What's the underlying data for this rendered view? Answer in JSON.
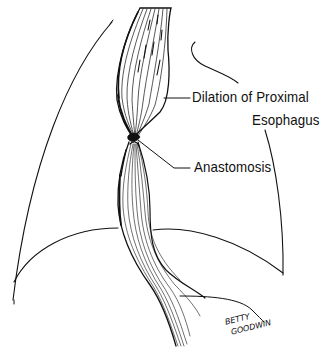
{
  "figure": {
    "type": "medical-illustration",
    "labels": [
      {
        "id": "dilation",
        "line1": "Dilation of Proximal",
        "line2": "Esophagus"
      },
      {
        "id": "anastomosis",
        "line1": "Anastomosis"
      }
    ],
    "signature": {
      "line1": "BETTY",
      "line2": "GOODWIN"
    },
    "colors": {
      "ink": "#111111",
      "background": "#ffffff"
    }
  }
}
